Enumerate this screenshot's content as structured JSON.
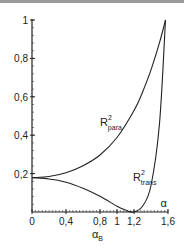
{
  "chart_data": {
    "type": "line",
    "title": "",
    "xlabel": "α",
    "ylabel": "",
    "xlim": [
      0,
      1.6
    ],
    "ylim": [
      0,
      1
    ],
    "grid": false,
    "legend": "inline labels",
    "x_ticks": [
      "0",
      "0,4",
      "0,8",
      "1",
      "1,2",
      "1,6"
    ],
    "x_tick_values": [
      0,
      0.4,
      0.8,
      1.0,
      1.2,
      1.6
    ],
    "y_ticks": [
      "0,2",
      "0,4",
      "0,6",
      "0,8",
      "1"
    ],
    "y_tick_values": [
      0.2,
      0.4,
      0.6,
      0.8,
      1.0
    ],
    "annotations": [
      {
        "text": "α",
        "position": "x-axis end"
      },
      {
        "text": "α",
        "subscript": "B",
        "position": "below x-axis near 1.19 (Brewster angle)"
      }
    ],
    "series": [
      {
        "name": "R²para",
        "label_main": "R",
        "label_sup": "2",
        "label_sub": "para",
        "x": [
          0,
          0.2,
          0.4,
          0.6,
          0.8,
          1.0,
          1.2,
          1.3,
          1.4,
          1.5,
          1.5708
        ],
        "values": [
          0.179,
          0.185,
          0.204,
          0.241,
          0.297,
          0.388,
          0.528,
          0.624,
          0.74,
          0.882,
          1.0
        ]
      },
      {
        "name": "R²trans",
        "label_main": "R",
        "label_sup": "2",
        "label_sub": "trans",
        "x": [
          0,
          0.2,
          0.4,
          0.6,
          0.8,
          1.0,
          1.1,
          1.19,
          1.3,
          1.4,
          1.5,
          1.5708
        ],
        "values": [
          0.179,
          0.172,
          0.155,
          0.124,
          0.082,
          0.03,
          0.01,
          0.0,
          0.03,
          0.138,
          0.461,
          1.0
        ]
      }
    ]
  }
}
